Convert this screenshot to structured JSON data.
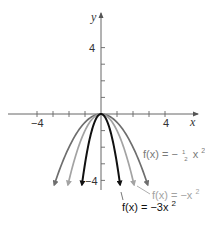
{
  "chart_data": {
    "type": "line",
    "title": "",
    "xlabel": "x",
    "ylabel": "y",
    "xlim": [
      -5.5,
      5.8
    ],
    "ylim": [
      -4.3,
      6.0
    ],
    "grid": false,
    "x_ticks": [
      -4,
      -3,
      -2,
      -1,
      1,
      2,
      3,
      4
    ],
    "y_ticks": [
      4,
      3,
      2,
      1,
      -1,
      -2,
      -3,
      -4
    ],
    "x_tick_labels": [
      {
        "value": -4,
        "label": "−4"
      },
      {
        "value": 4,
        "label": "4"
      }
    ],
    "y_tick_labels": [
      {
        "value": 4,
        "label": "4"
      },
      {
        "value": -4,
        "label": "−4"
      }
    ],
    "series": [
      {
        "name": "f(x) = -1/2 x^2",
        "a": -0.5,
        "color": "#6e6e6e",
        "label_parts": [
          "f(x) = −",
          "1",
          "2",
          "x",
          "2"
        ]
      },
      {
        "name": "f(x) = -x^2",
        "a": -1,
        "color": "#a3a3a3",
        "label_parts": [
          "f(x) = −x",
          "2"
        ]
      },
      {
        "name": "f(x) = -3x^2",
        "a": -3,
        "color": "#111111",
        "label_parts": [
          "f(x) = −3x",
          "2"
        ]
      }
    ]
  },
  "labels": {
    "x_axis": "x",
    "y_axis": "y",
    "x_neg4": "−4",
    "x_pos4": "4",
    "y_pos4": "4",
    "y_neg4": "−4",
    "half_prefix": "f(x) = −",
    "half_num": "1",
    "half_den": "2",
    "half_var": "x",
    "half_exp": "2",
    "one_text": "f(x) = −x",
    "one_exp": "2",
    "three_text": "f(x) = −3x",
    "three_exp": "2"
  }
}
